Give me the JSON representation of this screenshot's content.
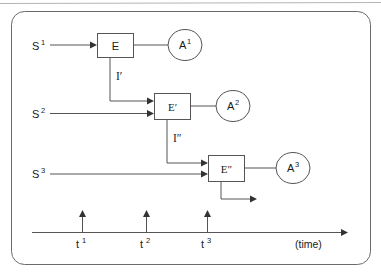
{
  "figure": {
    "border": {
      "type": "rounded-rectangle",
      "radius": 12
    },
    "colors": {
      "line": "#555555",
      "arrowhead": "#333333",
      "text": "#1a1a1a",
      "background": "#ffffff",
      "top_rule": "#b5b5b5"
    },
    "stimuli": [
      {
        "id": "s1",
        "base": "S",
        "sup": "1"
      },
      {
        "id": "s2",
        "base": "S",
        "sup": "2"
      },
      {
        "id": "s3",
        "base": "S",
        "sup": "3"
      }
    ],
    "events": [
      {
        "id": "e1",
        "label": "E"
      },
      {
        "id": "e2",
        "label": "E′"
      },
      {
        "id": "e3",
        "label": "E″"
      }
    ],
    "actions": [
      {
        "id": "a1",
        "base": "A",
        "sup": "1"
      },
      {
        "id": "a2",
        "base": "A",
        "sup": "2"
      },
      {
        "id": "a3",
        "base": "A",
        "sup": "3"
      }
    ],
    "internal_links": [
      {
        "id": "i1",
        "label": "I′"
      },
      {
        "id": "i2",
        "label": "I″"
      }
    ],
    "timeline": {
      "axis_label": "(time)",
      "ticks": [
        {
          "id": "t1",
          "base": "t",
          "sup": "1"
        },
        {
          "id": "t2",
          "base": "t",
          "sup": "2"
        },
        {
          "id": "t3",
          "base": "t",
          "sup": "3"
        }
      ]
    }
  }
}
